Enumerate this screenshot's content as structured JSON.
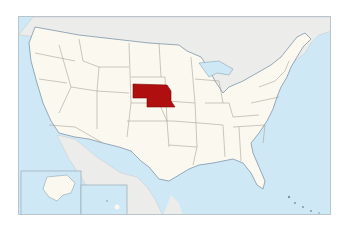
{
  "map": {
    "title": "Nebraska locator map",
    "highlighted_state": "Nebraska",
    "colors": {
      "background": "#ffffff",
      "ocean": "#cfe8f5",
      "neighbor_land": "#ececea",
      "us_land": "#fbf9ef",
      "state_border": "#a7a398",
      "highlight": "#b00f0f",
      "frame": "#b9c4cc",
      "coast": "#7d96ab"
    },
    "insets": [
      {
        "name": "Alaska"
      },
      {
        "name": "Hawaii"
      }
    ]
  }
}
